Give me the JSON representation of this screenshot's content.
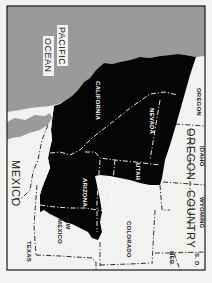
{
  "map": {
    "title": "Mexican Cession and Oregon Country",
    "orientation": "rotated 90 degrees clockwise",
    "colors": {
      "ocean": "#9a9a9a",
      "highlighted_region": "#050505",
      "land": "#f2f2f0",
      "frame": "#1a1a1a"
    },
    "labels": {
      "ocean_line1": "PACIFIC",
      "ocean_line2": "OCEAN",
      "california": "CALIFORNIA",
      "nevada": "NEVADA",
      "oregon_state": "OREGON",
      "arizona": "ARIZONA",
      "utah": "UTAH",
      "idaho": "IDAHO",
      "oregon_country_line1": "OREGON",
      "oregon_country_line2": "COUNTRY",
      "mexico": "MEXICO",
      "new_mexico_line1": "NEW",
      "new_mexico_line2": "MEXICO",
      "wyoming": "WYOMING",
      "colorado": "COLORADO",
      "texas": "TEXAS",
      "nebraska": "NEB.",
      "south_dakota": "S. D."
    }
  }
}
